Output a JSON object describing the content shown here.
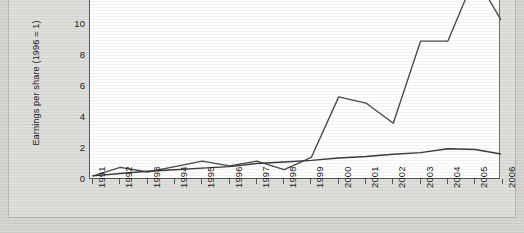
{
  "chart_data": {
    "type": "line",
    "title": "",
    "xlabel": "",
    "ylabel": "Earnings per share (1996 = 1)",
    "x": [
      1991,
      1992,
      1993,
      1994,
      1995,
      1996,
      1997,
      1998,
      1999,
      2000,
      2001,
      2002,
      2003,
      2004,
      2005,
      2006
    ],
    "categories": [
      "1991",
      "1992",
      "1993",
      "1994",
      "1995",
      "1996",
      "1997",
      "1998",
      "1999",
      "2000",
      "2001",
      "2002",
      "2003",
      "2004",
      "2005",
      "2006"
    ],
    "xlim": [
      1990.6,
      2006.6
    ],
    "ylim": [
      0,
      12.4
    ],
    "yticks": [
      0,
      2,
      4,
      6,
      8,
      10
    ],
    "ytick_labels": [
      "0",
      "2",
      "4",
      "6",
      "8",
      "10"
    ],
    "grid": false,
    "legend": "none",
    "note": "Top of plot is cropped; the 2005 peak of the volatile series extends above the visible area.",
    "series": [
      {
        "name": "volatile-series",
        "color": "#4a4a4c",
        "values": [
          0.2,
          0.75,
          0.45,
          0.8,
          1.15,
          0.85,
          1.15,
          0.6,
          1.4,
          5.3,
          4.9,
          3.6,
          8.9,
          8.9,
          13.1,
          10.1
        ]
      },
      {
        "name": "flat-series",
        "color": "#3a3a3c",
        "values": [
          0.2,
          0.35,
          0.5,
          0.6,
          0.7,
          0.8,
          1.0,
          1.1,
          1.2,
          1.35,
          1.45,
          1.6,
          1.7,
          1.95,
          1.9,
          1.6
        ]
      }
    ]
  },
  "axis": {
    "y_title": "Earnings per share (1996 = 1)",
    "y_labels": [
      "10",
      "8",
      "6",
      "4",
      "2",
      "0"
    ],
    "x_labels": [
      "1991",
      "1992",
      "1993",
      "1994",
      "1995",
      "1996",
      "1997",
      "1998",
      "1999",
      "2000",
      "2001",
      "2002",
      "2003",
      "2004",
      "2005",
      "2006"
    ]
  },
  "colors": {
    "page_background": "#d6d5d2",
    "plot_background": "#ffffff",
    "axis_line": "#55565a",
    "series_primary": "#4a4a4c",
    "series_secondary": "#3a3a3c",
    "text": "#1d1d1b"
  }
}
